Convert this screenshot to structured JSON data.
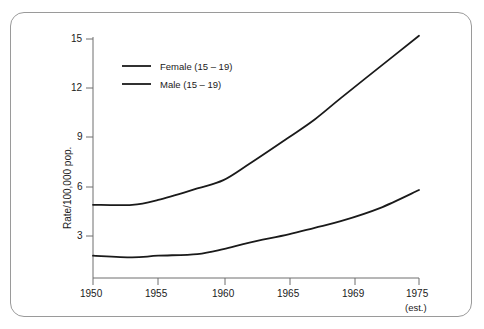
{
  "chart_data": {
    "type": "line",
    "title": "",
    "subtitle": "",
    "xlabel": "",
    "ylabel": "Rate/100,000 pop.",
    "xlim": [
      1950,
      1975
    ],
    "ylim": [
      0,
      15.8
    ],
    "grid": false,
    "legend_position": "top-left inside plot",
    "x_tick_labels": [
      "1950",
      "1955",
      "1960",
      "1965",
      "1969",
      "1975"
    ],
    "x_tick_values": [
      1950,
      1955,
      1960,
      1965,
      1969,
      1975
    ],
    "x_tick_note": "(est.)",
    "x_tick_note_for": "1975",
    "y_tick_labels": [
      "3",
      "6",
      "9",
      "12",
      "15"
    ],
    "y_tick_values": [
      3,
      6,
      9,
      12,
      15
    ],
    "series": [
      {
        "name": "Female (15 – 19)",
        "color": "#1a1a1a",
        "x": [
          1950,
          1953,
          1955,
          1958,
          1960,
          1962,
          1965,
          1967,
          1969,
          1972,
          1975
        ],
        "values": [
          4.9,
          4.9,
          5.2,
          5.9,
          6.4,
          7.4,
          9.0,
          10.1,
          11.4,
          13.3,
          15.2
        ]
      },
      {
        "name": "Male (15 – 19)",
        "color": "#1a1a1a",
        "x": [
          1950,
          1953,
          1955,
          1958,
          1960,
          1962,
          1965,
          1967,
          1969,
          1972,
          1975
        ],
        "values": [
          1.8,
          1.7,
          1.8,
          1.9,
          2.2,
          2.6,
          3.1,
          3.5,
          3.9,
          4.7,
          5.8
        ]
      }
    ]
  },
  "legend": {
    "items": [
      {
        "label": "Female (15 – 19)"
      },
      {
        "label": "Male (15 – 19)"
      }
    ]
  },
  "axes": {
    "y_title": "Rate/100,000 pop.",
    "x_note": "(est.)"
  },
  "colors": {
    "line": "#1a1a1a",
    "axis": "#6f6f6f",
    "frame": "#9a9a9a",
    "background": "#ffffff"
  }
}
